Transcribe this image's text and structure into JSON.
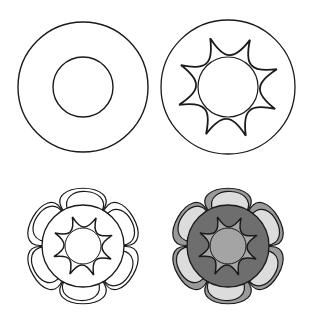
{
  "diagram": {
    "type": "step-by-step drawing tutorial",
    "layout": "2x2 grid",
    "colors": {
      "background": "#ffffff",
      "stroke": "#1a1a1a",
      "petal_outer_fill": "#9a9a9a",
      "petal_inner_fill": "#dcdcdc",
      "ring_fill": "#6e6e6e",
      "star_fill": "#a8a8a8",
      "center_fill": "#a4a4a4"
    },
    "steps": [
      {
        "index": 1,
        "description": "Two concentric circles",
        "cx": 83,
        "cy": 87,
        "outer_r": 65,
        "inner_r": 30
      },
      {
        "index": 2,
        "description": "Outer circle with inner circle surrounded by 8-pointed curved star",
        "cx": 228,
        "cy": 87,
        "outer_r": 67,
        "inner_r": 30,
        "star_points": 8,
        "star_tip_r": 52,
        "star_rotation_deg": -20
      },
      {
        "index": 3,
        "description": "Six double-outlined petals around a ring containing small circle and 8-pointed star",
        "cx": 83,
        "cy": 246,
        "ring_r": 41,
        "center_r": 18,
        "star_points": 8,
        "star_tip_r": 31,
        "petals": 6,
        "petal_tip_r": 70
      },
      {
        "index": 4,
        "description": "Same flower shaded in tones of gray",
        "cx": 228,
        "cy": 246,
        "ring_r": 41,
        "center_r": 18,
        "star_points": 8,
        "star_tip_r": 31,
        "petals": 6,
        "petal_tip_r": 70
      }
    ]
  }
}
